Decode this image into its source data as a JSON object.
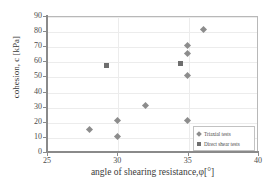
{
  "chart_data": {
    "type": "scatter",
    "title": "",
    "xlabel": "angle of shearing resistance,φ[°]",
    "ylabel": "cohesion, c [kPa]",
    "xlim": [
      25,
      40
    ],
    "ylim": [
      0,
      90
    ],
    "xticks": [
      25,
      30,
      35,
      40
    ],
    "yticks": [
      0,
      10,
      20,
      30,
      40,
      50,
      60,
      70,
      80,
      90
    ],
    "grid": "both",
    "legend_position": "lower-right",
    "series": [
      {
        "name": "Triaxial tests",
        "marker": "diamond",
        "color": "#8c8c8c",
        "points": [
          {
            "x": 28.0,
            "y": 15.2
          },
          {
            "x": 30.0,
            "y": 20.6
          },
          {
            "x": 30.0,
            "y": 10.4
          },
          {
            "x": 32.0,
            "y": 30.6
          },
          {
            "x": 35.0,
            "y": 70.6
          },
          {
            "x": 35.0,
            "y": 65.2
          },
          {
            "x": 35.0,
            "y": 50.6
          },
          {
            "x": 35.0,
            "y": 20.6
          },
          {
            "x": 36.1,
            "y": 81.0
          }
        ]
      },
      {
        "name": "Direct shear tests",
        "marker": "square",
        "color": "#6e6e6e",
        "points": [
          {
            "x": 29.2,
            "y": 57.0
          },
          {
            "x": 34.5,
            "y": 58.6
          }
        ]
      }
    ]
  },
  "legend": {
    "entries": [
      {
        "label": "Triaxial tests"
      },
      {
        "label": "Direct shear tests"
      }
    ]
  }
}
